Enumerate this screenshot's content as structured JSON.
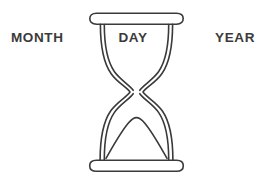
{
  "illustration": {
    "title": "Hourglass time-unit diagram",
    "subject_icon": "hourglass-icon",
    "stroke_color": "#3a3a3a",
    "fill_color": "#ffffff",
    "background_color": "#ffffff",
    "stroke_width": 1.6
  },
  "labels": {
    "left": "MONTH",
    "center": "DAY",
    "right": "YEAR"
  },
  "parts": {
    "top_cap": "hourglass-top-cap",
    "bottom_cap": "hourglass-bottom-cap",
    "upper_chamber": "hourglass-upper-chamber",
    "lower_chamber": "hourglass-lower-chamber",
    "neck": "hourglass-neck",
    "sand_pile": "hourglass-sand-pile"
  }
}
